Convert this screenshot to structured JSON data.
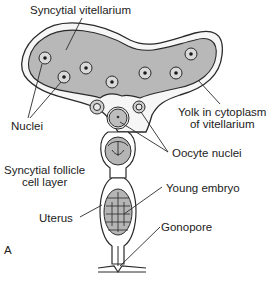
{
  "diagram": {
    "panel_letter": "A",
    "labels": {
      "syncytial_vitellarium": "Syncytial vitellarium",
      "nuclei": "Nuclei",
      "yolk_line1": "Yolk in cytoplasm",
      "yolk_line2": "of vitellarium",
      "oocyte_nuclei": "Oocyte nuclei",
      "follicle_line1": "Syncytial follicle",
      "follicle_line2": "cell layer",
      "young_embryo": "Young embryo",
      "uterus": "Uterus",
      "gonopore": "Gonopore"
    },
    "colors": {
      "yolk_fill": "#b8b8b8",
      "outline": "#2a2a2a",
      "background": "#ffffff",
      "stipple": "#ececec"
    }
  }
}
